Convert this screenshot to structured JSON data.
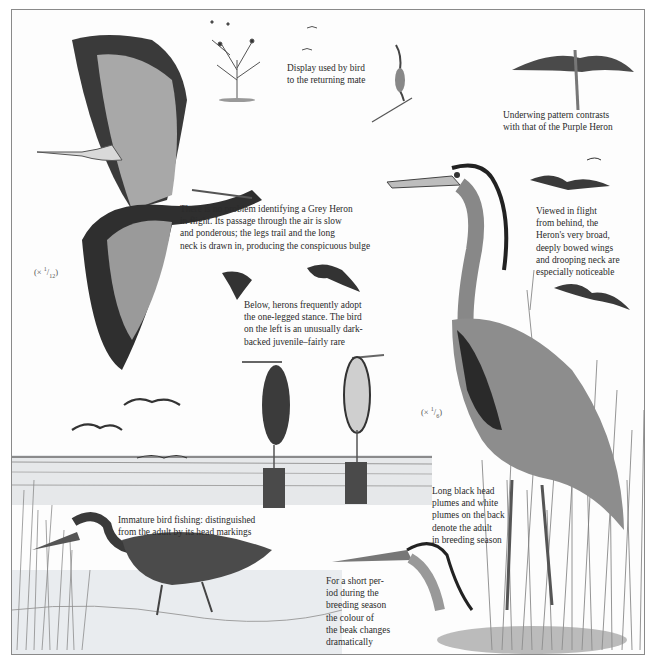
{
  "page": {
    "subject": "Grey Heron",
    "colors": {
      "frame": "#8a8a8a",
      "ink": "#2b2b2b",
      "paper": "#fdfdfd",
      "grey_plumage": "#9a9a9a",
      "dark_plumage": "#2e2e2e",
      "water": "#cfd3d6",
      "reeds": "#8c8c8c"
    }
  },
  "captions": {
    "display": [
      "Display used by bird",
      "to the returning mate"
    ],
    "underwing": [
      "Underwing pattern contrasts",
      "with that of the Purple Heron"
    ],
    "flight_id": [
      "There is no problem identifying a Grey Heron",
      "in flight. Its passage through the air is slow",
      "and ponderous; the legs trail and the long",
      "neck is drawn in, producing the conspicuous bulge"
    ],
    "from_behind": [
      "Viewed in flight",
      "from behind, the",
      "Heron's very broad,",
      "deeply bowed wings",
      "and drooping neck are",
      "especially noticeable"
    ],
    "one_legged": [
      "Below, herons frequently adopt",
      "the one-legged stance. The bird",
      "on the left is an unusually dark-",
      "backed juvenile–fairly rare"
    ],
    "breeding_plumes": [
      "Long black head",
      "plumes and white",
      "plumes on the back",
      "denote the adult",
      "in breeding season"
    ],
    "immature": [
      "Immature bird fishing: distinguished",
      "from the adult by its head markings"
    ],
    "beak_colour": [
      "For a short per-",
      "iod during the",
      "breeding season",
      "the colour of",
      "the beak changes",
      "dramatically"
    ]
  },
  "scales": {
    "flying_heron": {
      "prefix": "(× ",
      "num": "1",
      "den": "12",
      "suffix": ")"
    },
    "standing_heron": {
      "prefix": "(× ",
      "num": "1",
      "den": "6",
      "suffix": ")"
    }
  },
  "illustrations": [
    "display-tree-with-herons",
    "displaying-heron-on-branch",
    "underwing-flight-view",
    "large-flying-grey-heron",
    "birds-in-flight-from-behind",
    "small-flying-herons",
    "distant-flock",
    "perched-herons-on-posts",
    "standing-adult-grey-heron",
    "immature-heron-fishing",
    "heron-head-beak-detail",
    "marsh-landscape"
  ]
}
